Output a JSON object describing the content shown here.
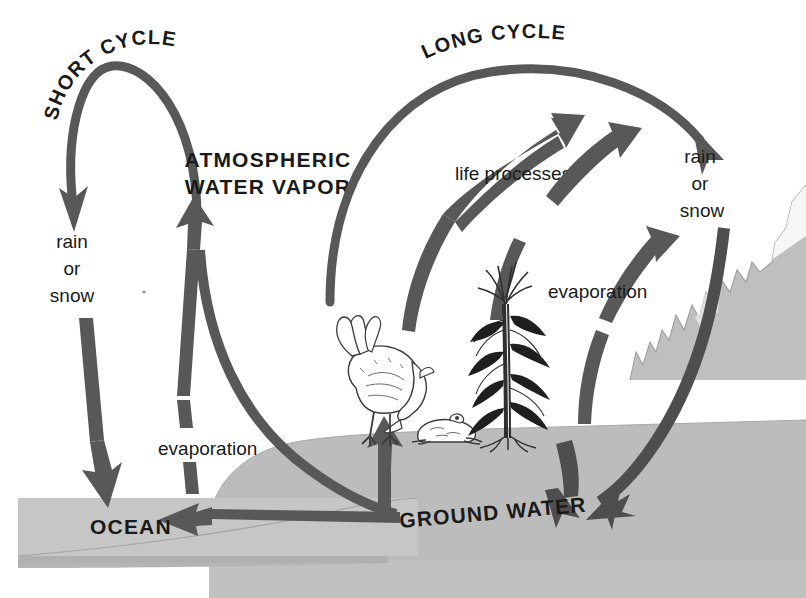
{
  "diagram": {
    "background_color": "#ffffff",
    "ink_color": "#4a4a4a",
    "text_color": "#1a1a1a",
    "land_color": "#b9b9b9",
    "ocean_color": "#c3c3c3",
    "mountain_color": "#b9b9b9"
  },
  "labels": {
    "short_cycle": "SHORT CYCLE",
    "long_cycle": "LONG CYCLE",
    "atmospheric_line1": "ATMOSPHERIC",
    "atmospheric_line2": "WATER VAPOR",
    "life_processes": "life processes",
    "evaporation_left": "evaporation",
    "evaporation_right": "evaporation",
    "ocean": "OCEAN",
    "ground_water": "GROUND WATER",
    "rain_left": {
      "line1": "rain",
      "line2": "or",
      "line3": "snow"
    },
    "rain_right": {
      "line1": "rain",
      "line2": "or",
      "line3": "snow"
    }
  },
  "illustrations": {
    "chicken": "chicken-illustration",
    "frog": "frog-illustration",
    "corn": "corn-plant-illustration",
    "mountain": "mountain-range-illustration"
  },
  "arrows": {
    "short_cycle_arc": "ocean-to-rain-arc",
    "ocean_evaporation_up": "ocean-evaporation-arrow",
    "vapor_to_ground": "vapor-to-ground-arrow",
    "ground_evaporation_up": "ground-evaporation-arrow",
    "ground_to_ocean": "ground-water-to-ocean-arrow",
    "long_cycle_arc": "long-cycle-arc",
    "life_processes_up": "life-processes-arrow",
    "transpiration_up": "transpiration-arrow",
    "land_evaporation_up": "land-evaporation-arrow",
    "mountain_runoff": "mountain-runoff-arrow",
    "rain_to_ground": "rain-to-ground-arrow"
  }
}
